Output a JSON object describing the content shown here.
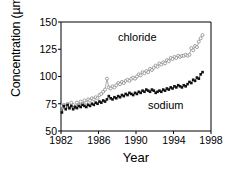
{
  "chart_data": {
    "type": "line",
    "title": "",
    "xlabel": "Year",
    "ylabel": "Concentration (µmol/L)",
    "xlim": [
      1982,
      1998
    ],
    "ylim": [
      50,
      150
    ],
    "xticks": [
      1982,
      1986,
      1990,
      1994,
      1998
    ],
    "yticks": [
      50,
      75,
      100,
      125,
      150
    ],
    "grid": false,
    "legend": "inline-annotations",
    "series": [
      {
        "name": "chloride",
        "marker": "open-circle",
        "color": "#8a8a8a",
        "x": [
          1982.1,
          1982.3,
          1982.5,
          1982.7,
          1982.9,
          1983.1,
          1983.3,
          1983.5,
          1983.7,
          1983.9,
          1984.1,
          1984.3,
          1984.5,
          1984.7,
          1984.9,
          1985.1,
          1985.3,
          1985.5,
          1985.7,
          1985.9,
          1986.1,
          1986.3,
          1986.5,
          1986.7,
          1986.9,
          1987.1,
          1987.3,
          1987.5,
          1987.7,
          1987.9,
          1988.1,
          1988.3,
          1988.5,
          1988.7,
          1988.9,
          1989.1,
          1989.3,
          1989.5,
          1989.7,
          1989.9,
          1990.1,
          1990.3,
          1990.5,
          1990.7,
          1990.9,
          1991.1,
          1991.3,
          1991.5,
          1991.7,
          1991.9,
          1992.1,
          1992.3,
          1992.5,
          1992.7,
          1992.9,
          1993.1,
          1993.3,
          1993.5,
          1993.7,
          1993.9,
          1994.1,
          1994.3,
          1994.5,
          1994.7,
          1994.9,
          1995.1,
          1995.3,
          1995.5,
          1995.7,
          1995.9,
          1996.1,
          1996.3,
          1996.5,
          1996.7,
          1996.9,
          1997.1
        ],
        "y": [
          73,
          74,
          72,
          75,
          71,
          76,
          74,
          72,
          76,
          74,
          77,
          75,
          78,
          76,
          79,
          78,
          80,
          79,
          81,
          80,
          83,
          84,
          86,
          88,
          98,
          90,
          89,
          91,
          90,
          92,
          94,
          93,
          95,
          94,
          96,
          97,
          96,
          98,
          99,
          98,
          100,
          102,
          101,
          104,
          103,
          105,
          104,
          107,
          106,
          108,
          110,
          109,
          112,
          111,
          113,
          112,
          115,
          114,
          117,
          116,
          118,
          117,
          119,
          118,
          119,
          119,
          120,
          119,
          120,
          126,
          124,
          128,
          127,
          132,
          135,
          138
        ]
      },
      {
        "name": "sodium",
        "marker": "filled-square",
        "color": "#111111",
        "x": [
          1982.1,
          1982.3,
          1982.5,
          1982.7,
          1982.9,
          1983.1,
          1983.3,
          1983.5,
          1983.7,
          1983.9,
          1984.1,
          1984.3,
          1984.5,
          1984.7,
          1984.9,
          1985.1,
          1985.3,
          1985.5,
          1985.7,
          1985.9,
          1986.1,
          1986.3,
          1986.5,
          1986.7,
          1986.9,
          1987.1,
          1987.3,
          1987.5,
          1987.7,
          1987.9,
          1988.1,
          1988.3,
          1988.5,
          1988.7,
          1988.9,
          1989.1,
          1989.3,
          1989.5,
          1989.7,
          1989.9,
          1990.1,
          1990.3,
          1990.5,
          1990.7,
          1990.9,
          1991.1,
          1991.3,
          1991.5,
          1991.7,
          1991.9,
          1992.1,
          1992.3,
          1992.5,
          1992.7,
          1992.9,
          1993.1,
          1993.3,
          1993.5,
          1993.7,
          1993.9,
          1994.1,
          1994.3,
          1994.5,
          1994.7,
          1994.9,
          1995.1,
          1995.3,
          1995.5,
          1995.7,
          1995.9,
          1996.1,
          1996.3,
          1996.5,
          1996.7,
          1996.9,
          1997.1
        ],
        "y": [
          67,
          73,
          70,
          74,
          71,
          73,
          70,
          72,
          71,
          73,
          72,
          74,
          73,
          72,
          74,
          73,
          75,
          74,
          76,
          75,
          77,
          76,
          78,
          77,
          79,
          82,
          80,
          79,
          81,
          80,
          82,
          81,
          83,
          82,
          84,
          83,
          85,
          84,
          83,
          85,
          84,
          86,
          85,
          87,
          86,
          88,
          87,
          86,
          88,
          87,
          85,
          86,
          87,
          86,
          88,
          87,
          89,
          88,
          90,
          89,
          91,
          90,
          92,
          91,
          90,
          92,
          91,
          93,
          95,
          94,
          97,
          96,
          99,
          98,
          102,
          104
        ]
      }
    ]
  },
  "axes": {
    "ylabel": "Concentration (µmol/L)",
    "xlabel": "Year",
    "ytick_labels": [
      "150",
      "125",
      "100",
      "75",
      "50"
    ],
    "xtick_labels": [
      "1982",
      "1986",
      "1990",
      "1994",
      "1998"
    ]
  },
  "annotations": {
    "chloride": "chloride",
    "sodium": "sodium"
  },
  "colors": {
    "chloride": "#8a8a8a",
    "sodium": "#111111",
    "axis": "#000000",
    "background": "#ffffff"
  }
}
